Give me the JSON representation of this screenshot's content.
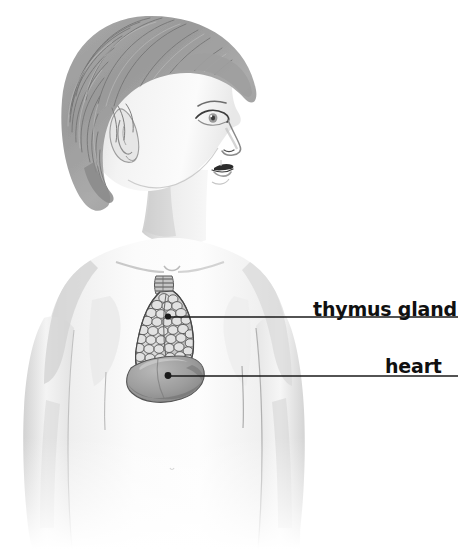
{
  "figure": {
    "style": "pencil / graphite medical illustration",
    "background_color": "#ffffff",
    "width": 458,
    "height": 549
  },
  "labels": [
    {
      "id": "thymus",
      "text": "thymus gland",
      "text_color": "#101010",
      "leader_line_color": "#1a1a1a",
      "leader_from_x": 168,
      "leader_from_y": 317,
      "leader_to_x": 458,
      "leader_to_y": 317,
      "marker": "dot"
    },
    {
      "id": "heart",
      "text": "heart",
      "text_color": "#101010",
      "leader_line_color": "#1a1a1a",
      "leader_from_x": 168,
      "leader_from_y": 376,
      "leader_to_x": 458,
      "leader_to_y": 376,
      "marker": "dot"
    }
  ],
  "anatomy": {
    "skin_tone": "#f2f2f2",
    "skin_shadow": "#d8d8d8",
    "hair_color": "#9a9a9a",
    "hair_shadow": "#6e6e6e",
    "thymus_color": "#cfcfcf",
    "thymus_outline": "#4a4a4a",
    "heart_color": "#9e9e9e",
    "heart_outline": "#5a5a5a",
    "trachea_color": "#b8b8b8",
    "parts": [
      "hair",
      "ear",
      "eye",
      "nose",
      "lips",
      "neck",
      "clavicle",
      "shoulders",
      "arms",
      "chest",
      "trachea",
      "thymus gland",
      "heart"
    ]
  }
}
